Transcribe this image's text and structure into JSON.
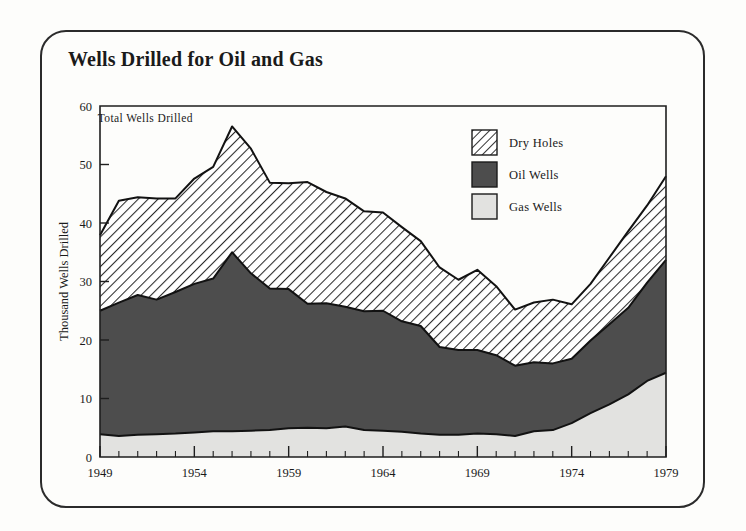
{
  "figure": {
    "title": "Wells Drilled for Oil and Gas",
    "frame_style": "rounded-rectangle-border"
  },
  "annotations": [
    {
      "name": "total-wells-annotation",
      "text": "Total Wells Drilled",
      "x_year": 1951.4,
      "y_value": 57.2
    }
  ],
  "legend": {
    "position": "top-right-inside",
    "items": [
      {
        "label": "Dry Holes",
        "swatch": "diagonal-hatch",
        "color": "#ffffff"
      },
      {
        "label": "Oil Wells",
        "swatch": "solid",
        "color": "#4d4d4d"
      },
      {
        "label": "Gas Wells",
        "swatch": "solid",
        "color": "#e2e2e0"
      }
    ]
  },
  "chart_data": {
    "type": "area",
    "stacked": true,
    "title": "Wells Drilled for Oil and Gas",
    "xlabel": "",
    "ylabel": "Thousand Wells Drilled",
    "xlim": [
      1949,
      1979
    ],
    "ylim": [
      0,
      60
    ],
    "yticks": [
      0,
      10,
      20,
      30,
      40,
      50,
      60
    ],
    "xticks_labeled": [
      1949,
      1954,
      1959,
      1964,
      1969,
      1974,
      1979
    ],
    "xtick_interval_minor": 1,
    "grid": false,
    "x": [
      1949,
      1950,
      1951,
      1952,
      1953,
      1954,
      1955,
      1956,
      1957,
      1958,
      1959,
      1960,
      1961,
      1962,
      1963,
      1964,
      1965,
      1966,
      1967,
      1968,
      1969,
      1970,
      1971,
      1972,
      1973,
      1974,
      1975,
      1976,
      1977,
      1978,
      1979
    ],
    "series": [
      {
        "name": "Gas Wells",
        "color": "#e2e2e0",
        "pattern": "solid",
        "values": [
          3.9,
          3.6,
          3.8,
          3.9,
          4.0,
          4.2,
          4.4,
          4.4,
          4.5,
          4.6,
          4.9,
          5.0,
          4.9,
          5.2,
          4.6,
          4.5,
          4.3,
          4.0,
          3.8,
          3.8,
          4.0,
          3.9,
          3.6,
          4.4,
          4.6,
          5.8,
          7.5,
          9.0,
          10.7,
          13.0,
          14.4
        ]
      },
      {
        "name": "Oil Wells",
        "color": "#4d4d4d",
        "pattern": "solid",
        "values": [
          21.1,
          22.8,
          23.9,
          23.0,
          24.2,
          25.4,
          26.1,
          30.6,
          26.9,
          24.2,
          23.8,
          21.2,
          21.4,
          20.5,
          20.3,
          20.5,
          18.9,
          18.4,
          15.0,
          14.5,
          14.3,
          13.5,
          12.0,
          11.8,
          11.4,
          11.0,
          12.4,
          13.7,
          14.8,
          16.8,
          19.3
        ]
      },
      {
        "name": "Dry Holes",
        "color": "#ffffff",
        "pattern": "diagonal-hatch",
        "values": [
          12.9,
          17.4,
          16.7,
          17.3,
          16.0,
          18.0,
          19.1,
          21.5,
          21.3,
          18.1,
          18.1,
          20.8,
          19.0,
          18.5,
          17.1,
          16.8,
          16.1,
          14.5,
          13.6,
          12.0,
          13.7,
          11.8,
          9.6,
          10.2,
          10.9,
          9.3,
          9.7,
          11.4,
          13.1,
          13.2,
          14.3
        ]
      }
    ],
    "total": [
      37.9,
      43.8,
      44.4,
      44.2,
      44.2,
      47.6,
      49.6,
      56.5,
      52.7,
      46.9,
      46.8,
      47.0,
      45.3,
      44.2,
      42.0,
      41.8,
      39.3,
      36.9,
      32.4,
      30.3,
      32.0,
      29.2,
      25.2,
      26.4,
      26.9,
      26.1,
      29.6,
      34.1,
      38.6,
      43.0,
      48.0
    ]
  }
}
